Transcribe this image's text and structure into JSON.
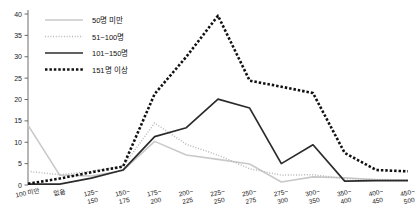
{
  "chart_data": {
    "type": "line",
    "title": "",
    "subtitle": "",
    "xlabel": "",
    "ylabel": "",
    "ylim": [
      0,
      40
    ],
    "yticks": [
      0,
      5,
      10,
      15,
      20,
      25,
      30,
      35,
      40
    ],
    "grid": false,
    "legend_position": "top-left",
    "categories": [
      "100 미만",
      "없음",
      "125~\n150",
      "150~\n175",
      "175~\n200",
      "200~\n225",
      "225~\n250",
      "250~\n275",
      "275~\n300",
      "300~\n350",
      "350~\n400",
      "400~\n450",
      "450~\n500"
    ],
    "categories_line1": [
      "100 미만",
      "없음",
      "125~",
      "150~",
      "175~",
      "200~",
      "225~",
      "250~",
      "275~",
      "300~",
      "350~",
      "400~",
      "450~"
    ],
    "categories_line2": [
      "",
      "",
      "150",
      "175",
      "200",
      "225",
      "250",
      "275",
      "300",
      "350",
      "400",
      "450",
      "500"
    ],
    "series": [
      {
        "name": "50명 미만",
        "style": "solid",
        "color": "#c9c9c9",
        "width": 1.6,
        "values": [
          14.0,
          2.3,
          2.1,
          3.4,
          10.2,
          7.0,
          6.0,
          4.9,
          0.7,
          1.9,
          1.7,
          1.2,
          1.1
        ]
      },
      {
        "name": "51~100명",
        "style": "dotted-fine",
        "color": "#b8b8b8",
        "width": 1.5,
        "values": [
          3.2,
          2.4,
          3.2,
          4.4,
          14.5,
          9.5,
          7.0,
          3.8,
          2.3,
          2.4,
          1.5,
          1.3,
          1.2
        ]
      },
      {
        "name": "101~150명",
        "style": "solid",
        "color": "#2b2b2b",
        "width": 1.7,
        "values": [
          0.2,
          0.2,
          1.6,
          3.5,
          11.3,
          13.4,
          20.1,
          18.0,
          5.0,
          9.4,
          0.9,
          1.0,
          1.0
        ]
      },
      {
        "name": "151명 이상",
        "style": "dotted-bold",
        "color": "#111111",
        "width": 2.6,
        "values": [
          0.3,
          1.5,
          3.0,
          4.3,
          21.3,
          30.0,
          39.6,
          24.4,
          23.0,
          21.5,
          7.5,
          3.5,
          3.2
        ]
      }
    ]
  },
  "legend": {
    "items": [
      {
        "label": "50명 미만"
      },
      {
        "label": "51~100명"
      },
      {
        "label": "101~150명"
      },
      {
        "label": "151명 이상"
      }
    ]
  }
}
